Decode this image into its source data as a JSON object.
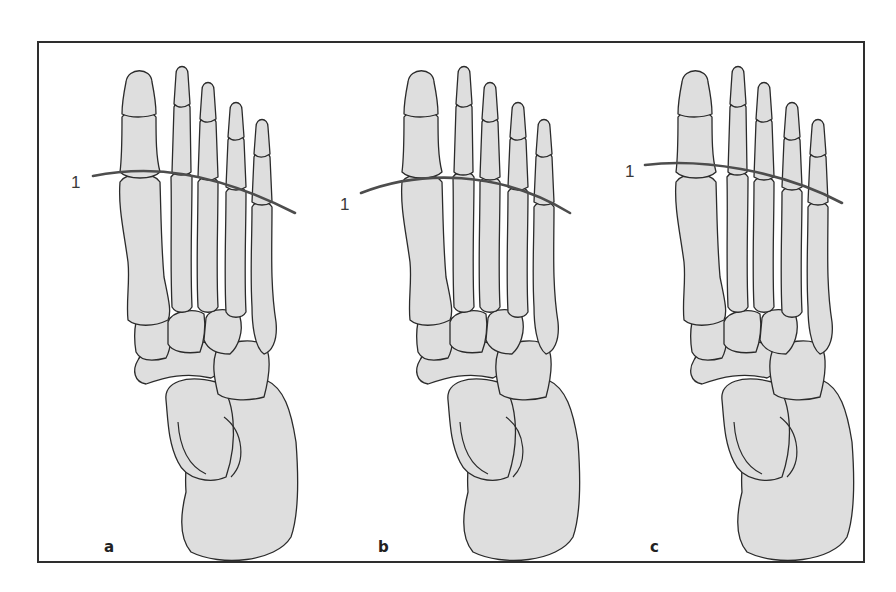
{
  "figure": {
    "panels": [
      {
        "id": "a",
        "label": "a",
        "line_label": "1"
      },
      {
        "id": "b",
        "label": "b",
        "line_label": "1"
      },
      {
        "id": "c",
        "label": "c",
        "line_label": "1"
      }
    ],
    "colors": {
      "bone_fill": "#dedede",
      "outline": "#2b2b2b",
      "metatarsal_line": "#4d4d4d",
      "frame": "#2e2e2e"
    }
  }
}
